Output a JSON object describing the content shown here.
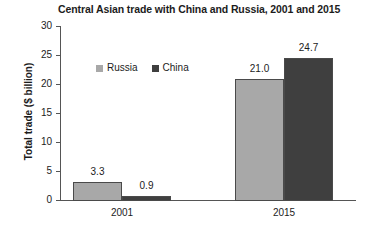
{
  "chart_data": {
    "type": "bar",
    "title": "Central Asian trade with China and Russia, 2001 and 2015",
    "xlabel": "",
    "ylabel": "Total trade ($ billion)",
    "categories": [
      "2001",
      "2015"
    ],
    "series": [
      {
        "name": "Russia",
        "color": "#a8a8a8",
        "values": [
          3.3,
          21.0
        ],
        "labels": [
          "3.3",
          "21.0"
        ]
      },
      {
        "name": "China",
        "color": "#3f3f3f",
        "values": [
          0.9,
          24.7
        ],
        "labels": [
          "0.9",
          "24.7"
        ]
      }
    ],
    "ylim": [
      0,
      30
    ],
    "yticks": [
      0,
      5,
      10,
      15,
      20,
      25,
      30
    ],
    "ytick_labels": [
      "0",
      "5",
      "10",
      "15",
      "20",
      "25",
      "30"
    ],
    "grid": false,
    "legend_position": "top-left-inside"
  },
  "legend": {
    "items": [
      {
        "label": "Russia",
        "color": "#a8a8a8"
      },
      {
        "label": "China",
        "color": "#3f3f3f"
      }
    ]
  },
  "colors": {
    "russia": "#a8a8a8",
    "china": "#3f3f3f",
    "axis": "#555555",
    "text": "#1c1c1c",
    "background": "#ffffff"
  }
}
